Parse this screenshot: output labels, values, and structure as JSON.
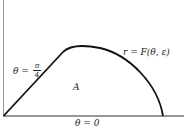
{
  "diagram": {
    "curve_label": "r = F(θ, ε)",
    "ray_label_prefix": "θ =",
    "ray_label_num": "π",
    "ray_label_den": "4",
    "region_label": "A",
    "baseline_label": "θ = 0",
    "stroke_color": "#111111"
  }
}
